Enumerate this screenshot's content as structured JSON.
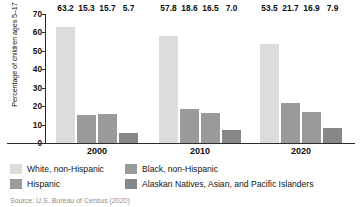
{
  "chart_data": {
    "type": "bar",
    "title": "",
    "subtitle": "",
    "xlabel": "",
    "ylabel": "Percentage of children ages 5–17",
    "categories": [
      "2000",
      "2010",
      "2020"
    ],
    "ylim": [
      0,
      70
    ],
    "yticks": [
      0,
      10,
      20,
      30,
      40,
      50,
      60,
      70
    ],
    "ytick_labels": [
      "0",
      "10",
      "20",
      "30",
      "40",
      "50",
      "60",
      "70"
    ],
    "grid": false,
    "legend_position": "below",
    "series": [
      {
        "name": "White, non-Hispanic",
        "color": "#dcdcdc",
        "values": [
          63.2,
          57.8,
          53.5
        ],
        "labels": [
          "63.2",
          "57.8",
          "53.5"
        ]
      },
      {
        "name": "Black, non-Hispanic",
        "color": "#9a9a9a",
        "values": [
          15.3,
          18.6,
          21.7
        ],
        "labels": [
          "15.3",
          "18.6",
          "21.7"
        ]
      },
      {
        "name": "Hispanic",
        "color": "#9a9a9a",
        "values": [
          15.7,
          16.5,
          16.9
        ],
        "labels": [
          "15.7",
          "16.5",
          "16.9"
        ]
      },
      {
        "name": "Alaskan Natives, Asian, and Pacific Islanders",
        "color": "#878787",
        "values": [
          5.7,
          7.0,
          7.9
        ],
        "labels": [
          "5.7",
          "7.0",
          "7.9"
        ]
      }
    ]
  },
  "legend": {
    "entries": [
      {
        "label": "White, non-Hispanic",
        "color": "#dcdcdc"
      },
      {
        "label": "Black, non-Hispanic",
        "color": "#9a9a9a"
      },
      {
        "label": "Hispanic",
        "color": "#9a9a9a"
      },
      {
        "label": "Alaskan Natives, Asian, and Pacific Islanders",
        "color": "#878787"
      }
    ]
  },
  "source": {
    "text": "Source: U.S. Bureau of Census (2020)"
  }
}
